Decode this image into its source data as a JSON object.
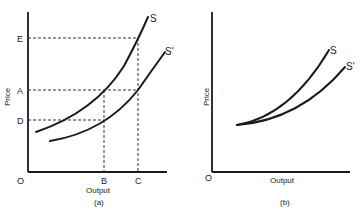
{
  "panels": [
    {
      "id": "a",
      "caption": "(a)",
      "xlabel": "Output",
      "ylabel": "Price",
      "origin_label": "O",
      "y_ticks": [
        "E",
        "A",
        "D"
      ],
      "x_ticks": [
        "B",
        "C"
      ],
      "curves": [
        {
          "name": "S"
        },
        {
          "name": "S'"
        }
      ]
    },
    {
      "id": "b",
      "caption": "(b)",
      "xlabel": "Output",
      "ylabel": "Price",
      "origin_label": "O",
      "curves": [
        {
          "name": "S"
        },
        {
          "name": "S'"
        }
      ]
    }
  ]
}
